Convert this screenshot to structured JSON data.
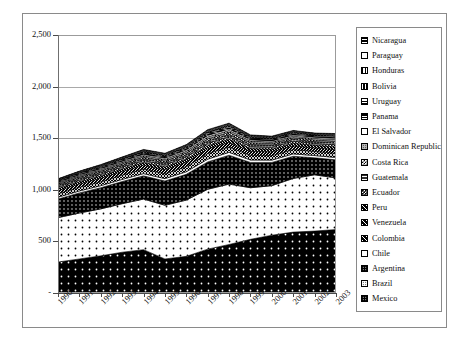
{
  "chart_data": {
    "type": "area",
    "stacked": true,
    "title": "",
    "xlabel": "",
    "ylabel": "",
    "grid": true,
    "legend_position": "right",
    "ylim": [
      0,
      2500
    ],
    "ytick_labels": [
      "2,500",
      "2,000",
      "1,500",
      "1,000",
      "500",
      "-"
    ],
    "ytick_values": [
      2500,
      2000,
      1500,
      1000,
      500,
      0
    ],
    "categories": [
      "1990",
      "1991",
      "1992",
      "1993",
      "1994",
      "1995",
      "1996",
      "1997",
      "1998",
      "1999",
      "2000",
      "2001",
      "2002",
      "2003"
    ],
    "series": [
      {
        "name": "Mexico",
        "pattern": "dot-sparse-on-black",
        "values": [
          300,
          330,
          360,
          395,
          420,
          330,
          355,
          425,
          470,
          520,
          560,
          590,
          600,
          615
        ]
      },
      {
        "name": "Brazil",
        "pattern": "dot-sparse-on-white",
        "values": [
          430,
          445,
          455,
          470,
          490,
          520,
          545,
          580,
          585,
          500,
          480,
          520,
          545,
          500
        ]
      },
      {
        "name": "Argentina",
        "pattern": "dot-dense-on-black",
        "values": [
          180,
          195,
          205,
          215,
          225,
          235,
          250,
          265,
          280,
          245,
          225,
          215,
          165,
          175
        ]
      },
      {
        "name": "Chile",
        "pattern": "solid-white",
        "values": [
          18,
          19,
          20,
          21,
          22,
          23,
          25,
          27,
          28,
          24,
          23,
          23,
          22,
          23
        ]
      },
      {
        "name": "Colombia",
        "pattern": "crosshatch-dark",
        "values": [
          34,
          36,
          38,
          41,
          44,
          47,
          50,
          54,
          52,
          45,
          43,
          42,
          40,
          41
        ]
      },
      {
        "name": "Venezuela",
        "pattern": "hatch-diag-dark",
        "values": [
          30,
          32,
          34,
          36,
          38,
          40,
          43,
          46,
          45,
          39,
          37,
          36,
          35,
          36
        ]
      },
      {
        "name": "Peru",
        "pattern": "hatch-backslash",
        "values": [
          20,
          21,
          22,
          23,
          25,
          26,
          28,
          30,
          30,
          26,
          25,
          25,
          24,
          25
        ]
      },
      {
        "name": "Ecuador",
        "pattern": "checker-dark",
        "values": [
          16,
          17,
          18,
          19,
          20,
          21,
          22,
          24,
          24,
          21,
          20,
          20,
          19,
          20
        ]
      },
      {
        "name": "Guatemala",
        "pattern": "grid-dark",
        "values": [
          14,
          15,
          16,
          17,
          18,
          19,
          20,
          22,
          22,
          19,
          18,
          18,
          17,
          18
        ]
      },
      {
        "name": "Costa Rica",
        "pattern": "checker-light",
        "values": [
          12,
          13,
          14,
          15,
          16,
          17,
          18,
          20,
          20,
          17,
          16,
          16,
          16,
          17
        ]
      },
      {
        "name": "Dominican Republic",
        "pattern": "dot-mid",
        "values": [
          11,
          12,
          13,
          14,
          15,
          16,
          17,
          19,
          19,
          16,
          15,
          15,
          15,
          16
        ]
      },
      {
        "name": "El Salvador",
        "pattern": "solid-white-2",
        "values": [
          9,
          10,
          10,
          11,
          12,
          13,
          14,
          15,
          15,
          13,
          12,
          12,
          12,
          13
        ]
      },
      {
        "name": "Panama",
        "pattern": "hline-dark",
        "values": [
          8,
          9,
          9,
          10,
          11,
          11,
          12,
          13,
          13,
          11,
          11,
          10,
          10,
          11
        ]
      },
      {
        "name": "Uruguay",
        "pattern": "hline-mid",
        "values": [
          7,
          8,
          8,
          9,
          9,
          10,
          11,
          12,
          12,
          10,
          9,
          9,
          8,
          9
        ]
      },
      {
        "name": "Bolivia",
        "pattern": "vline-dark",
        "values": [
          6,
          6,
          7,
          7,
          8,
          8,
          9,
          10,
          10,
          8,
          8,
          8,
          7,
          8
        ]
      },
      {
        "name": "Honduras",
        "pattern": "vline-light",
        "values": [
          5,
          5,
          6,
          6,
          7,
          7,
          8,
          8,
          8,
          7,
          7,
          6,
          6,
          7
        ]
      },
      {
        "name": "Paraguay",
        "pattern": "solid-white-3",
        "values": [
          4,
          4,
          5,
          5,
          6,
          6,
          6,
          7,
          7,
          6,
          6,
          5,
          5,
          6
        ]
      },
      {
        "name": "Nicaragua",
        "pattern": "dot-grid-black",
        "values": [
          3,
          4,
          4,
          4,
          5,
          5,
          5,
          6,
          6,
          5,
          5,
          5,
          4,
          5
        ]
      }
    ],
    "totals": [
      1107,
      1172,
      1224,
      1293,
      1366,
      1350,
      1423,
      1583,
      1616,
      1446,
      1450,
      1495,
      1470,
      1530
    ]
  },
  "legend": {
    "items": [
      {
        "label": "Nicaragua"
      },
      {
        "label": "Paraguay"
      },
      {
        "label": "Honduras"
      },
      {
        "label": "Bolivia"
      },
      {
        "label": "Uruguay"
      },
      {
        "label": "Panama"
      },
      {
        "label": "El Salvador"
      },
      {
        "label": "Dominican Republic"
      },
      {
        "label": "Costa Rica"
      },
      {
        "label": "Guatemala"
      },
      {
        "label": "Ecuador"
      },
      {
        "label": "Peru"
      },
      {
        "label": "Venezuela"
      },
      {
        "label": "Colombia"
      },
      {
        "label": "Chile"
      },
      {
        "label": "Argentina"
      },
      {
        "label": "Brazil"
      },
      {
        "label": "Mexico"
      }
    ]
  },
  "colors": {
    "axis": "#4a4a4a",
    "grid": "#a9a9a9",
    "frame": "#8a8a8a",
    "text": "#111111",
    "background": "#ffffff"
  }
}
